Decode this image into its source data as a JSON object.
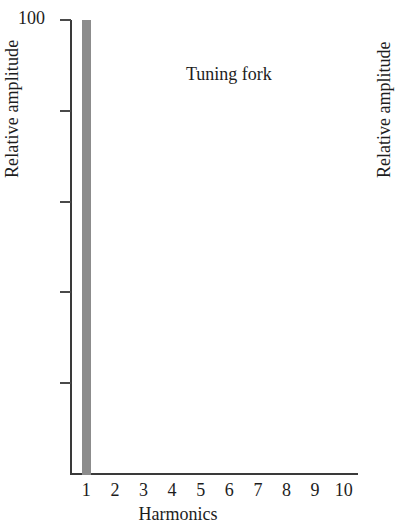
{
  "chart_data": {
    "type": "bar",
    "title": "Tuning fork",
    "xlabel": "Harmonics",
    "ylabel": "Relative amplitude",
    "categories": [
      "1",
      "2",
      "3",
      "4",
      "5",
      "6",
      "7",
      "8",
      "9",
      "10"
    ],
    "values": [
      100,
      0,
      0,
      0,
      0,
      0,
      0,
      0,
      0,
      0
    ],
    "ylim": [
      0,
      100
    ],
    "ytick_labels": [
      "100",
      "",
      "",
      "",
      ""
    ],
    "ytick_values": [
      100,
      80,
      60,
      40,
      20
    ],
    "grid": false,
    "legend": null,
    "bar_color": "#8c8c8c",
    "axis_color": "#3a3a3a"
  },
  "axis": {
    "ymax_label": "100"
  },
  "neighbor_panel": {
    "ylabel": "Relative amplitude"
  }
}
